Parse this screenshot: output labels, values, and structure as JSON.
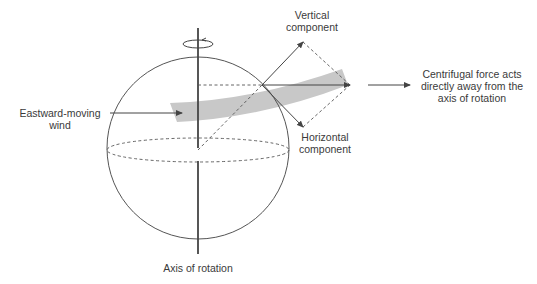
{
  "diagram": {
    "labels": {
      "vertical_component_line1": "Vertical",
      "vertical_component_line2": "component",
      "horizontal_component_line1": "Horizontal",
      "horizontal_component_line2": "component",
      "wind_line1": "Eastward-moving",
      "wind_line2": "wind",
      "centrifugal_line1": "Centrifugal force acts",
      "centrifugal_line2": "directly away from the",
      "centrifugal_line3": "axis of rotation",
      "axis": "Axis of rotation"
    },
    "colors": {
      "line": "#444444",
      "band": "#c8c8c8",
      "text": "#3a3a3a"
    }
  }
}
